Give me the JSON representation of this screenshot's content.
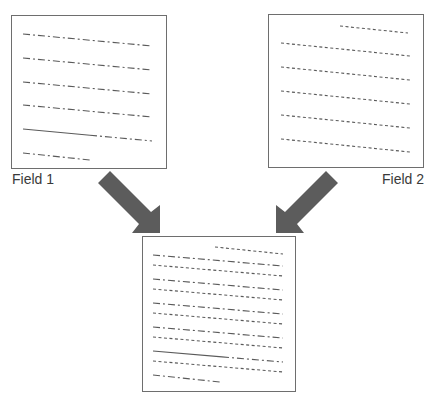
{
  "diagram": {
    "colors": {
      "line": "#5a5a5a",
      "border": "#6e6e6e",
      "arrow": "#5c5c5c",
      "label": "#3a3a3a"
    },
    "field1": {
      "label": "Field 1",
      "box": {
        "x": 11,
        "y": 15,
        "w": 156,
        "h": 154
      },
      "lines": [
        {
          "style": "dashdot",
          "x1": 23,
          "y1": 34,
          "x2": 152,
          "y2": 46
        },
        {
          "style": "dashdot",
          "x1": 23,
          "y1": 58,
          "x2": 152,
          "y2": 70
        },
        {
          "style": "dashdot",
          "x1": 23,
          "y1": 82,
          "x2": 152,
          "y2": 94
        },
        {
          "style": "dashdot",
          "x1": 23,
          "y1": 105,
          "x2": 152,
          "y2": 117
        },
        {
          "style": "solid-then-dashdot",
          "x1": 23,
          "y1": 129,
          "x2": 152,
          "y2": 141,
          "solid_until_x": 90
        },
        {
          "style": "dashdot",
          "x1": 23,
          "y1": 153,
          "x2": 90,
          "y2": 160
        }
      ]
    },
    "field2": {
      "label": "Field 2",
      "box": {
        "x": 268,
        "y": 14,
        "w": 156,
        "h": 154
      },
      "lines": [
        {
          "style": "dotted",
          "x1": 340,
          "y1": 26,
          "x2": 408,
          "y2": 33
        },
        {
          "style": "dotted",
          "x1": 281,
          "y1": 43,
          "x2": 410,
          "y2": 56
        },
        {
          "style": "dotted",
          "x1": 281,
          "y1": 67,
          "x2": 410,
          "y2": 80
        },
        {
          "style": "dotted",
          "x1": 281,
          "y1": 91,
          "x2": 410,
          "y2": 104
        },
        {
          "style": "dotted",
          "x1": 281,
          "y1": 115,
          "x2": 410,
          "y2": 128
        },
        {
          "style": "dotted",
          "x1": 281,
          "y1": 139,
          "x2": 410,
          "y2": 152
        }
      ]
    },
    "merged": {
      "box": {
        "x": 142,
        "y": 236,
        "w": 154,
        "h": 156
      },
      "lines": [
        {
          "style": "dotted",
          "x1": 215,
          "y1": 247,
          "x2": 283,
          "y2": 254
        },
        {
          "style": "dashdot",
          "x1": 153,
          "y1": 255,
          "x2": 283,
          "y2": 266
        },
        {
          "style": "dotted",
          "x1": 153,
          "y1": 265,
          "x2": 283,
          "y2": 276
        },
        {
          "style": "dashdot",
          "x1": 153,
          "y1": 279,
          "x2": 283,
          "y2": 290
        },
        {
          "style": "dotted",
          "x1": 153,
          "y1": 289,
          "x2": 283,
          "y2": 300
        },
        {
          "style": "dashdot",
          "x1": 153,
          "y1": 303,
          "x2": 283,
          "y2": 314
        },
        {
          "style": "dotted",
          "x1": 153,
          "y1": 313,
          "x2": 283,
          "y2": 324
        },
        {
          "style": "dashdot",
          "x1": 153,
          "y1": 327,
          "x2": 283,
          "y2": 338
        },
        {
          "style": "dotted",
          "x1": 153,
          "y1": 337,
          "x2": 283,
          "y2": 348
        },
        {
          "style": "solid-then-dashdot",
          "x1": 153,
          "y1": 351,
          "x2": 283,
          "y2": 362,
          "solid_until_x": 222
        },
        {
          "style": "dotted",
          "x1": 153,
          "y1": 361,
          "x2": 283,
          "y2": 372
        },
        {
          "style": "dashdot",
          "x1": 153,
          "y1": 375,
          "x2": 220,
          "y2": 382
        }
      ]
    },
    "arrows": [
      {
        "name": "arrow-field1-to-merged",
        "points": "98,183 110,171 151,212 160,205 160,233 132,233 139,224"
      },
      {
        "name": "arrow-field2-to-merged",
        "points": "338,183 326,171 285,212 276,205 276,233 304,233 297,224"
      }
    ]
  }
}
